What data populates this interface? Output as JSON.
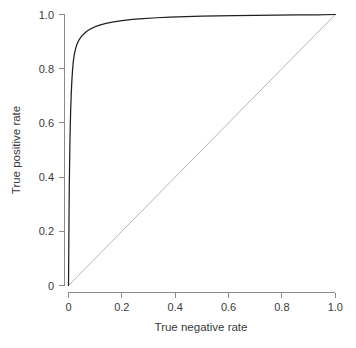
{
  "chart_data": {
    "type": "line",
    "title": "",
    "subtitle": "",
    "xlabel": "True negative rate",
    "ylabel": "True positive rate",
    "xlim": [
      0,
      1
    ],
    "ylim": [
      0,
      1
    ],
    "grid": false,
    "legend_position": "none",
    "x_ticks": [
      0,
      0.2,
      0.4,
      0.6,
      0.8,
      1.0
    ],
    "x_tick_labels": [
      "0",
      "0.2",
      "0.4",
      "0.6",
      "0.8",
      "1.0"
    ],
    "y_ticks": [
      0,
      0.2,
      0.4,
      0.6,
      0.8,
      1.0
    ],
    "y_tick_labels": [
      "0",
      "0.2",
      "0.4",
      "0.6",
      "0.8",
      "1.0"
    ],
    "series": [
      {
        "name": "ROC curve",
        "color": "#202020",
        "x": [
          0.0,
          0.001,
          0.002,
          0.003,
          0.004,
          0.005,
          0.006,
          0.008,
          0.01,
          0.012,
          0.015,
          0.018,
          0.021,
          0.025,
          0.03,
          0.035,
          0.04,
          0.05,
          0.06,
          0.07,
          0.085,
          0.1,
          0.12,
          0.14,
          0.17,
          0.2,
          0.24,
          0.28,
          0.33,
          0.38,
          0.44,
          0.5,
          0.56,
          0.62,
          0.7,
          0.78,
          0.86,
          0.93,
          1.0
        ],
        "y": [
          0.0,
          0.13,
          0.26,
          0.36,
          0.44,
          0.505,
          0.56,
          0.64,
          0.7,
          0.745,
          0.793,
          0.826,
          0.848,
          0.868,
          0.886,
          0.898,
          0.907,
          0.921,
          0.931,
          0.939,
          0.948,
          0.955,
          0.962,
          0.967,
          0.973,
          0.977,
          0.982,
          0.985,
          0.988,
          0.99,
          0.992,
          0.994,
          0.995,
          0.996,
          0.997,
          0.998,
          0.999,
          0.999,
          1.0
        ]
      },
      {
        "name": "Chance diagonal",
        "color": "#a9a9a9",
        "x": [
          0,
          1
        ],
        "y": [
          0,
          1
        ]
      }
    ]
  },
  "axes": {
    "x_axis_label": "True negative rate",
    "y_axis_label": "True positive rate"
  },
  "ticks": {
    "x": [
      "0",
      "0.2",
      "0.4",
      "0.6",
      "0.8",
      "1.0"
    ],
    "y": [
      "0",
      "0.2",
      "0.4",
      "0.6",
      "0.8",
      "1.0"
    ]
  },
  "colors": {
    "curve": "#202020",
    "chance": "#a9a9a9",
    "axis": "#8a8a8a",
    "text": "#3a3a3a",
    "background": "#ffffff"
  }
}
